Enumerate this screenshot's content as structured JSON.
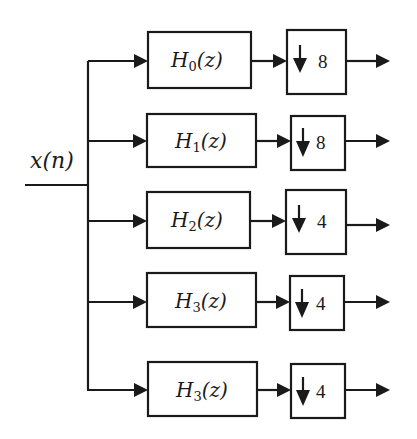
{
  "diagram": {
    "type": "analysis filter bank",
    "input": {
      "label": "x(n)"
    },
    "colors": {
      "stroke": "#1a1a1a",
      "background": "#ffffff"
    },
    "branches": [
      {
        "filter": {
          "name": "H",
          "subscript": "0",
          "arg": "(z)"
        },
        "downsample": {
          "symbol": "down-arrow",
          "factor": "8"
        }
      },
      {
        "filter": {
          "name": "H",
          "subscript": "1",
          "arg": "(z)"
        },
        "downsample": {
          "symbol": "down-arrow",
          "factor": "8"
        }
      },
      {
        "filter": {
          "name": "H",
          "subscript": "2",
          "arg": "(z)"
        },
        "downsample": {
          "symbol": "down-arrow",
          "factor": "4"
        }
      },
      {
        "filter": {
          "name": "H",
          "subscript": "3",
          "arg": "(z)"
        },
        "downsample": {
          "symbol": "down-arrow",
          "factor": "4"
        }
      },
      {
        "filter": {
          "name": "H",
          "subscript": "3",
          "arg": "(z)"
        },
        "downsample": {
          "symbol": "down-arrow",
          "factor": "4"
        }
      }
    ]
  }
}
